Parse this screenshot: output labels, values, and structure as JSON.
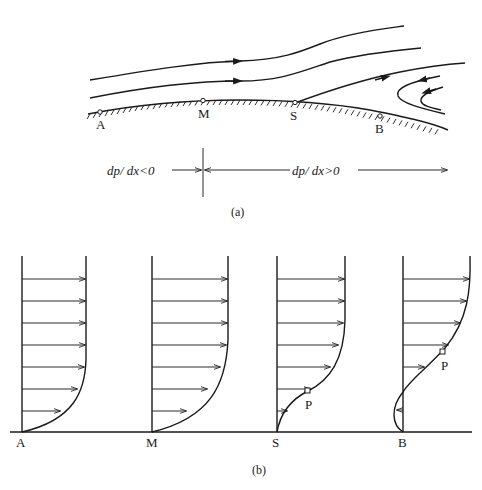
{
  "figure": {
    "part_a": {
      "caption": "(a)",
      "points": [
        {
          "label": "A",
          "x": 100,
          "y": 112
        },
        {
          "label": "M",
          "x": 203,
          "y": 101
        },
        {
          "label": "S",
          "x": 294,
          "y": 103
        },
        {
          "label": "B",
          "x": 380,
          "y": 117
        }
      ],
      "pressure_gradient": {
        "favorable_label": "dp/ dx<0",
        "adverse_label": "dp/ dx>0"
      }
    },
    "part_b": {
      "caption": "(b)",
      "profiles": [
        {
          "label": "A",
          "description": "full velocity profile, favorable pressure gradient"
        },
        {
          "label": "M",
          "description": "velocity profile at pressure minimum"
        },
        {
          "label": "S",
          "description": "separation point, zero wall shear",
          "inflection_label": "P"
        },
        {
          "label": "B",
          "description": "reversed flow near wall",
          "inflection_label": "P"
        }
      ]
    }
  }
}
